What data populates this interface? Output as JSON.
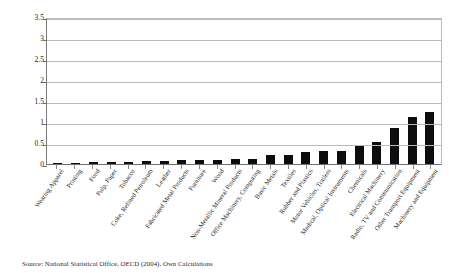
{
  "chart_data": {
    "type": "bar",
    "title": "",
    "subtitle": "",
    "xlabel": "",
    "ylabel": "",
    "ylim": [
      0,
      3.5
    ],
    "yticks": [
      "0",
      "0.5",
      "1",
      "1.5",
      "2",
      "2.5",
      "3",
      "3.5"
    ],
    "ytick_values": [
      0,
      0.5,
      1,
      1.5,
      2,
      2.5,
      3,
      3.5
    ],
    "grid": "horizontal",
    "legend": "none",
    "bar_color": "#0d0d0d",
    "categories": [
      "Wearing Apparel",
      "Printing",
      "Food",
      "Pulp, Paper",
      "Tobacco",
      "Coke, Refined Petroleum",
      "Leather",
      "Fabricated Metal Products",
      "Furniture",
      "Wood",
      "Non-Metallic Mineral Products",
      "Office Machinery, Computing",
      "Basic Metals",
      "Textiles",
      "Rubber and Plastics",
      "Motor Vehicles, Trailers",
      "Medical, Optical Instruments",
      "Chemicals",
      "Electrical Machinery",
      "Radio, TV and Communication",
      "Other Transport Equipment",
      "Machinery and Equipment"
    ],
    "values": [
      0.01,
      0.02,
      0.04,
      0.05,
      0.05,
      0.06,
      0.08,
      0.09,
      0.09,
      0.1,
      0.12,
      0.13,
      0.21,
      0.22,
      0.28,
      0.3,
      0.32,
      0.45,
      0.52,
      0.85,
      1.12,
      1.25
    ],
    "series": [
      {
        "name": "Value",
        "values": [
          0.01,
          0.02,
          0.04,
          0.05,
          0.05,
          0.06,
          0.08,
          0.09,
          0.09,
          0.1,
          0.12,
          0.13,
          0.21,
          0.22,
          0.28,
          0.3,
          0.32,
          0.45,
          0.52,
          0.85,
          1.12,
          1.25
        ]
      }
    ]
  },
  "source_note": "Source: National Statistical Office, OECD (2004), Own Calculations"
}
